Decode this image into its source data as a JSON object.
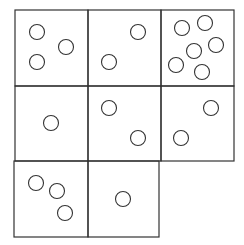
{
  "diagram": {
    "stroke_color": "#333333",
    "cells": [
      {
        "row": 0,
        "col": 0,
        "x": 15,
        "y": 10,
        "w": 73,
        "h": 76,
        "circle_count": 3,
        "circles": [
          [
            37,
            32
          ],
          [
            66,
            47
          ],
          [
            37,
            62
          ]
        ]
      },
      {
        "row": 0,
        "col": 1,
        "x": 88,
        "y": 10,
        "w": 73,
        "h": 76,
        "circle_count": 2,
        "circles": [
          [
            138,
            32
          ],
          [
            109,
            62
          ]
        ]
      },
      {
        "row": 0,
        "col": 2,
        "x": 161,
        "y": 10,
        "w": 73,
        "h": 76,
        "circle_count": 6,
        "circles": [
          [
            182,
            28
          ],
          [
            205,
            23
          ],
          [
            194,
            51
          ],
          [
            216,
            45
          ],
          [
            176,
            65
          ],
          [
            202,
            72
          ]
        ]
      },
      {
        "row": 1,
        "col": 0,
        "x": 15,
        "y": 86,
        "w": 73,
        "h": 75,
        "circle_count": 1,
        "circles": [
          [
            51,
            123
          ]
        ]
      },
      {
        "row": 1,
        "col": 1,
        "x": 88,
        "y": 86,
        "w": 73,
        "h": 75,
        "circle_count": 2,
        "circles": [
          [
            109,
            108
          ],
          [
            138,
            138
          ]
        ]
      },
      {
        "row": 1,
        "col": 2,
        "x": 161,
        "y": 86,
        "w": 73,
        "h": 75,
        "circle_count": 2,
        "circles": [
          [
            211,
            108
          ],
          [
            181,
            138
          ]
        ]
      },
      {
        "row": 2,
        "col": 0,
        "x": 14,
        "y": 161,
        "w": 74,
        "h": 76,
        "circle_count": 3,
        "circles": [
          [
            36,
            183
          ],
          [
            57,
            191
          ],
          [
            65,
            213
          ]
        ]
      },
      {
        "row": 2,
        "col": 1,
        "x": 88,
        "y": 161,
        "w": 71,
        "h": 76,
        "circle_count": 1,
        "circles": [
          [
            123,
            199
          ]
        ]
      }
    ],
    "circle_radius": 7.5
  }
}
